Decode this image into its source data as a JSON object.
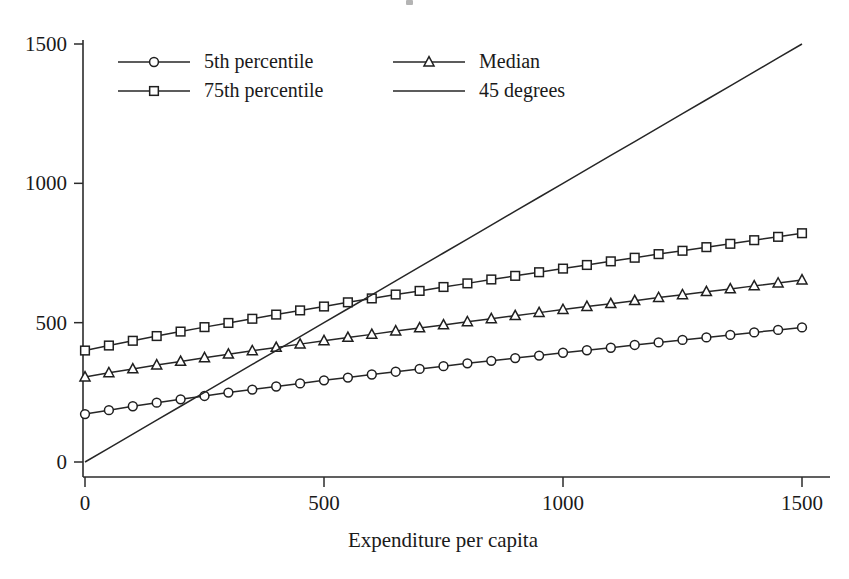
{
  "chart_data": {
    "type": "line",
    "title": "",
    "xlabel": "Expenditure per capita",
    "ylabel": "",
    "xlim": [
      0,
      1550
    ],
    "ylim": [
      0,
      1560
    ],
    "xticks": [
      0,
      500,
      1000,
      1500
    ],
    "xtick_labels": [
      "0",
      "500",
      "1000",
      "1500"
    ],
    "yticks": [
      0,
      500,
      1000,
      1500
    ],
    "ytick_labels": [
      "0",
      "500",
      "1000",
      "1500"
    ],
    "grid": false,
    "legend_position": "top-left",
    "x": [
      0,
      50,
      100,
      150,
      200,
      250,
      300,
      350,
      400,
      450,
      500,
      550,
      600,
      650,
      700,
      750,
      800,
      850,
      900,
      950,
      1000,
      1050,
      1100,
      1150,
      1200,
      1250,
      1300,
      1350,
      1400,
      1450,
      1500
    ],
    "series": [
      {
        "name": "5th percentile",
        "marker": "circle",
        "values": [
          172,
          186,
          200,
          213,
          225,
          237,
          249,
          260,
          271,
          282,
          293,
          303,
          314,
          324,
          334,
          344,
          354,
          363,
          373,
          382,
          392,
          401,
          410,
          420,
          429,
          438,
          447,
          456,
          465,
          474,
          483
        ]
      },
      {
        "name": "Median",
        "marker": "triangle",
        "values": [
          305,
          320,
          334,
          348,
          361,
          374,
          387,
          399,
          411,
          423,
          435,
          447,
          458,
          470,
          481,
          492,
          503,
          514,
          525,
          536,
          547,
          558,
          568,
          579,
          590,
          600,
          611,
          621,
          632,
          642,
          653
        ]
      },
      {
        "name": "75th percentile",
        "marker": "square",
        "values": [
          400,
          418,
          435,
          452,
          468,
          484,
          499,
          514,
          529,
          544,
          558,
          573,
          587,
          601,
          614,
          628,
          641,
          655,
          668,
          681,
          694,
          707,
          720,
          733,
          746,
          758,
          771,
          783,
          796,
          808,
          821
        ]
      },
      {
        "name": "45 degrees",
        "marker": "none",
        "values": [
          0,
          50,
          100,
          150,
          200,
          250,
          300,
          350,
          400,
          450,
          500,
          550,
          600,
          650,
          700,
          750,
          800,
          850,
          900,
          950,
          1000,
          1050,
          1100,
          1150,
          1200,
          1250,
          1300,
          1350,
          1400,
          1450,
          1500
        ]
      }
    ],
    "legend": [
      {
        "label": "5th percentile",
        "marker": "circle"
      },
      {
        "label": "Median",
        "marker": "triangle"
      },
      {
        "label": "75th percentile",
        "marker": "square"
      },
      {
        "label": "45 degrees",
        "marker": "none"
      }
    ]
  }
}
